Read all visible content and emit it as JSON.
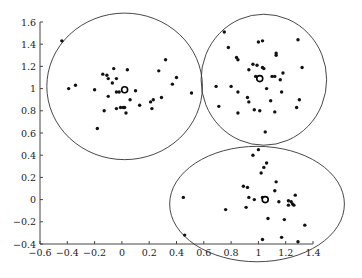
{
  "chart_data": {
    "type": "scatter",
    "title": "",
    "xlabel": "",
    "ylabel": "",
    "xlim": [
      -0.6,
      1.4
    ],
    "ylim": [
      -0.4,
      1.6
    ],
    "grid": false,
    "legend": null,
    "x_ticks": [
      "-0.6",
      "-0.4",
      "-0.2",
      "0",
      "0.2",
      "0.4",
      "0.6",
      "0.8",
      "1",
      "1.2",
      "1.4"
    ],
    "y_ticks": [
      "-0.4",
      "-0.2",
      "0",
      "0.2",
      "0.4",
      "0.6",
      "0.8",
      "1",
      "1.2",
      "1.4",
      "1.6"
    ],
    "clusters": [
      {
        "name": "cluster-1",
        "centroid": [
          0.02,
          0.99
        ],
        "boundary": {
          "cx": 0.02,
          "cy": 1.02,
          "rx": 0.57,
          "ry": 0.66
        },
        "points": [
          [
            -0.44,
            1.43
          ],
          [
            -0.39,
            1.0
          ],
          [
            -0.34,
            1.03
          ],
          [
            -0.2,
            0.99
          ],
          [
            -0.18,
            0.64
          ],
          [
            -0.14,
            1.13
          ],
          [
            -0.13,
            0.8
          ],
          [
            -0.11,
            1.12
          ],
          [
            -0.1,
            1.09
          ],
          [
            -0.1,
            0.93
          ],
          [
            -0.07,
            1.05
          ],
          [
            -0.06,
            1.18
          ],
          [
            -0.04,
            1.09
          ],
          [
            -0.04,
            0.82
          ],
          [
            -0.04,
            0.97
          ],
          [
            -0.02,
            0.97
          ],
          [
            -0.01,
            0.83
          ],
          [
            0.01,
            0.83
          ],
          [
            0.02,
            0.83
          ],
          [
            0.03,
            0.78
          ],
          [
            0.04,
            1.17
          ],
          [
            0.06,
            0.9
          ],
          [
            0.1,
            0.98
          ],
          [
            0.13,
            0.85
          ],
          [
            0.21,
            0.88
          ],
          [
            0.23,
            0.9
          ],
          [
            0.22,
            0.82
          ],
          [
            0.27,
            1.16
          ],
          [
            0.29,
            0.92
          ],
          [
            0.32,
            1.26
          ],
          [
            0.37,
            1.04
          ],
          [
            0.4,
            1.1
          ],
          [
            0.51,
            0.96
          ]
        ]
      },
      {
        "name": "cluster-2",
        "centroid": [
          1.01,
          1.09
        ],
        "boundary": {
          "cx": 1.04,
          "cy": 1.08,
          "rx": 0.46,
          "ry": 0.59
        },
        "points": [
          [
            0.75,
            1.51
          ],
          [
            0.78,
            1.37
          ],
          [
            0.84,
            1.28
          ],
          [
            0.85,
            1.26
          ],
          [
            1.0,
            1.42
          ],
          [
            1.03,
            1.43
          ],
          [
            1.29,
            1.44
          ],
          [
            1.13,
            1.32
          ],
          [
            1.13,
            1.3
          ],
          [
            0.96,
            1.22
          ],
          [
            0.99,
            1.21
          ],
          [
            0.93,
            1.17
          ],
          [
            1.03,
            1.19
          ],
          [
            1.04,
            1.18
          ],
          [
            0.98,
            1.11
          ],
          [
            1.1,
            1.11
          ],
          [
            1.12,
            1.11
          ],
          [
            1.18,
            1.14
          ],
          [
            1.16,
            1.08
          ],
          [
            1.32,
            1.19
          ],
          [
            0.69,
            1.02
          ],
          [
            0.8,
            1.02
          ],
          [
            0.85,
            0.97
          ],
          [
            1.06,
            1.0
          ],
          [
            1.17,
            0.97
          ],
          [
            0.92,
            0.92
          ],
          [
            0.93,
            0.88
          ],
          [
            1.09,
            0.89
          ],
          [
            1.3,
            0.9
          ],
          [
            0.71,
            0.84
          ],
          [
            0.85,
            0.78
          ],
          [
            0.97,
            0.81
          ],
          [
            1.01,
            0.8
          ],
          [
            1.12,
            0.79
          ],
          [
            1.28,
            0.83
          ],
          [
            1.05,
            0.61
          ]
        ]
      },
      {
        "name": "cluster-3",
        "centroid": [
          1.05,
          0.0
        ],
        "boundary": {
          "cx": 0.99,
          "cy": -0.04,
          "rx": 0.64,
          "ry": 0.52
        },
        "points": [
          [
            1.0,
            0.45
          ],
          [
            0.96,
            0.4
          ],
          [
            1.06,
            0.33
          ],
          [
            1.04,
            0.29
          ],
          [
            1.02,
            0.24
          ],
          [
            0.89,
            0.12
          ],
          [
            0.92,
            0.11
          ],
          [
            1.13,
            0.16
          ],
          [
            1.12,
            0.08
          ],
          [
            1.27,
            0.04
          ],
          [
            0.45,
            0.02
          ],
          [
            0.93,
            0.02
          ],
          [
            0.97,
            0.0
          ],
          [
            1.03,
            0.02
          ],
          [
            1.15,
            -0.02
          ],
          [
            1.22,
            -0.01
          ],
          [
            1.24,
            -0.02
          ],
          [
            1.22,
            -0.05
          ],
          [
            1.25,
            -0.04
          ],
          [
            1.26,
            -0.05
          ],
          [
            0.76,
            -0.09
          ],
          [
            0.91,
            -0.07
          ],
          [
            1.07,
            -0.17
          ],
          [
            1.19,
            -0.18
          ],
          [
            1.34,
            -0.23
          ],
          [
            0.46,
            -0.32
          ],
          [
            1.03,
            -0.36
          ],
          [
            1.17,
            -0.34
          ],
          [
            1.29,
            -0.38
          ]
        ]
      }
    ]
  },
  "axes": {
    "x_tick_labels": [
      "−0.6",
      "−0.4",
      "−0.2",
      "0",
      "0.2",
      "0.4",
      "0.6",
      "0.8",
      "1",
      "1.2",
      "1.4"
    ],
    "y_tick_labels": [
      "1.6",
      "1.4",
      "1.2",
      "1",
      "0.8",
      "0.6",
      "0.4",
      "0.2",
      "0",
      "−0.2",
      "−0.4"
    ]
  }
}
